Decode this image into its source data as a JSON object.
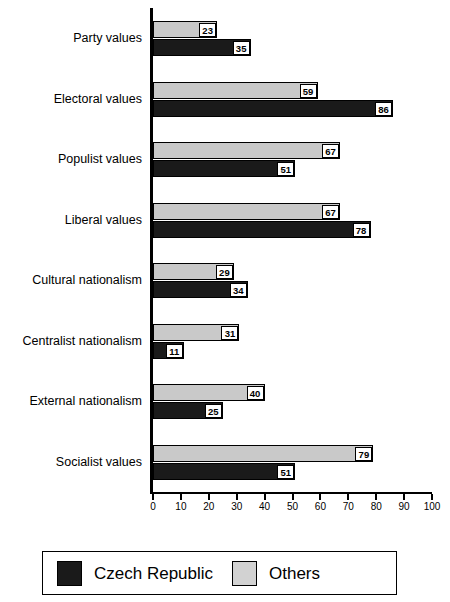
{
  "chart_data": {
    "type": "bar",
    "orientation": "horizontal",
    "title": "",
    "xlabel": "",
    "ylabel": "",
    "xlim": [
      0,
      100
    ],
    "xticks": [
      0,
      10,
      20,
      30,
      40,
      50,
      60,
      70,
      80,
      90,
      100
    ],
    "grid": false,
    "legend_position": "bottom",
    "categories": [
      "Party values",
      "Electoral values",
      "Populist values",
      "Liberal values",
      "Cultural nationalism",
      "Centralist nationalism",
      "External nationalism",
      "Socialist values"
    ],
    "series": [
      {
        "name": "Others",
        "color": "#c9c9c9",
        "values": [
          23,
          59,
          67,
          67,
          29,
          31,
          40,
          79
        ]
      },
      {
        "name": "Czech Republic",
        "color": "#1a1a1a",
        "values": [
          35,
          86,
          51,
          78,
          34,
          11,
          25,
          51
        ]
      }
    ]
  },
  "legend": {
    "entries": [
      {
        "label": "Czech Republic",
        "color": "#1a1a1a"
      },
      {
        "label": "Others",
        "color": "#d2d2d2"
      }
    ]
  }
}
